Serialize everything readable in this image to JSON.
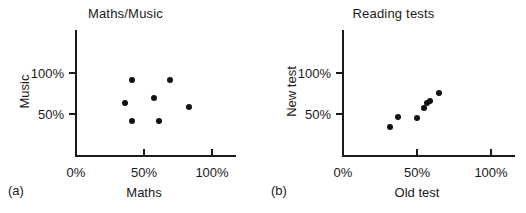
{
  "figure": {
    "width": 526,
    "height": 213,
    "background": "#ffffff",
    "ink": "#111111"
  },
  "panels": [
    {
      "key": "a",
      "label": "(a)",
      "title": "Maths/Music",
      "xlabel": "Maths",
      "ylabel": "Music",
      "xticks": [
        "0%",
        "50%",
        "100%"
      ],
      "yticks": [
        "50%",
        "100%"
      ]
    },
    {
      "key": "b",
      "label": "(b)",
      "title": "Reading tests",
      "xlabel": "Old test",
      "ylabel": "New test",
      "xticks": [
        "0%",
        "50%",
        "100%"
      ],
      "yticks": [
        "50%",
        "100%"
      ]
    }
  ],
  "chart_data": [
    {
      "type": "scatter",
      "panel": "(a)",
      "title": "Maths/Music",
      "xlabel": "Maths",
      "ylabel": "Music",
      "xlim": [
        0,
        118
      ],
      "ylim": [
        0,
        122
      ],
      "xticks": [
        0,
        50,
        100
      ],
      "xticklabels": [
        "0%",
        "50%",
        "100%"
      ],
      "yticks": [
        50,
        100
      ],
      "yticklabels": [
        "50%",
        "100%"
      ],
      "grid": false,
      "legend": null,
      "marker": "filled-circle",
      "points": [
        {
          "x": 41,
          "y": 92
        },
        {
          "x": 36,
          "y": 64
        },
        {
          "x": 41,
          "y": 41
        },
        {
          "x": 57,
          "y": 70
        },
        {
          "x": 61,
          "y": 41
        },
        {
          "x": 69,
          "y": 91
        },
        {
          "x": 83,
          "y": 59
        }
      ]
    },
    {
      "type": "scatter",
      "panel": "(b)",
      "title": "Reading tests",
      "xlabel": "Old test",
      "ylabel": "New test",
      "xlim": [
        0,
        118
      ],
      "ylim": [
        0,
        122
      ],
      "xticks": [
        0,
        50,
        100
      ],
      "xticklabels": [
        "0%",
        "50%",
        "100%"
      ],
      "yticks": [
        50,
        100
      ],
      "yticklabels": [
        "50%",
        "100%"
      ],
      "grid": false,
      "legend": null,
      "marker": "filled-circle",
      "points": [
        {
          "x": 32,
          "y": 34
        },
        {
          "x": 37,
          "y": 46
        },
        {
          "x": 50,
          "y": 45
        },
        {
          "x": 55,
          "y": 57
        },
        {
          "x": 57,
          "y": 64
        },
        {
          "x": 59,
          "y": 66
        },
        {
          "x": 65,
          "y": 76
        }
      ]
    }
  ]
}
